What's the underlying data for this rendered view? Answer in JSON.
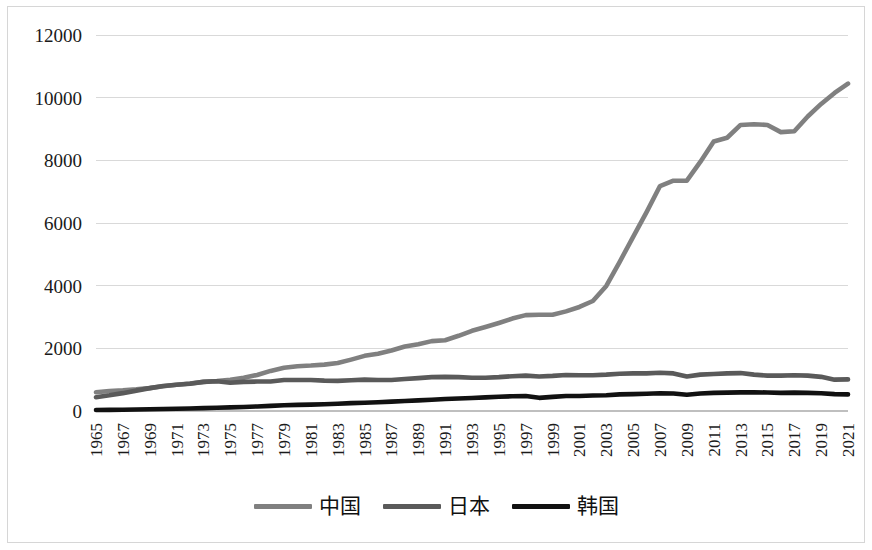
{
  "chart_data": {
    "type": "line",
    "title": "",
    "xlabel": "",
    "ylabel": "",
    "ylim": [
      0,
      12000
    ],
    "ytick_labels": [
      "0",
      "2000",
      "4000",
      "6000",
      "8000",
      "10000",
      "12000"
    ],
    "ytick_values": [
      0,
      2000,
      4000,
      6000,
      8000,
      10000,
      12000
    ],
    "grid": true,
    "legend_position": "bottom",
    "x": [
      1965,
      1966,
      1967,
      1968,
      1969,
      1970,
      1971,
      1972,
      1973,
      1974,
      1975,
      1976,
      1977,
      1978,
      1979,
      1980,
      1981,
      1982,
      1983,
      1984,
      1985,
      1986,
      1987,
      1988,
      1989,
      1990,
      1991,
      1992,
      1993,
      1994,
      1995,
      1996,
      1997,
      1998,
      1999,
      2000,
      2001,
      2002,
      2003,
      2004,
      2005,
      2006,
      2007,
      2008,
      2009,
      2010,
      2011,
      2012,
      2013,
      2014,
      2015,
      2016,
      2017,
      2018,
      2019,
      2020,
      2021
    ],
    "xtick_labels": [
      "1965",
      "1967",
      "1969",
      "1971",
      "1973",
      "1975",
      "1977",
      "1979",
      "1981",
      "1983",
      "1985",
      "1987",
      "1989",
      "1991",
      "1993",
      "1995",
      "1997",
      "1999",
      "2001",
      "2003",
      "2005",
      "2007",
      "2009",
      "2011",
      "2013",
      "2015",
      "2017",
      "2019",
      "2021"
    ],
    "series": [
      {
        "name": "中国",
        "color": "#808080",
        "width": 4.6,
        "values": [
          600,
          640,
          660,
          690,
          730,
          790,
          840,
          880,
          930,
          960,
          1000,
          1060,
          1150,
          1280,
          1380,
          1430,
          1450,
          1480,
          1530,
          1640,
          1760,
          1830,
          1930,
          2060,
          2130,
          2230,
          2260,
          2400,
          2560,
          2680,
          2810,
          2950,
          3060,
          3070,
          3070,
          3180,
          3320,
          3510,
          3990,
          4760,
          5560,
          6350,
          7180,
          7350,
          7350,
          7950,
          8600,
          8720,
          9130,
          9150,
          9130,
          8900,
          8930,
          9400,
          9800,
          10150,
          10450
        ]
      },
      {
        "name": "日本",
        "color": "#5a5a5a",
        "width": 4.6,
        "values": [
          440,
          500,
          570,
          650,
          730,
          800,
          840,
          870,
          930,
          950,
          900,
          930,
          940,
          940,
          990,
          990,
          990,
          970,
          960,
          980,
          1000,
          990,
          990,
          1020,
          1050,
          1080,
          1090,
          1080,
          1060,
          1060,
          1080,
          1110,
          1130,
          1100,
          1120,
          1150,
          1140,
          1140,
          1160,
          1190,
          1200,
          1200,
          1220,
          1200,
          1100,
          1160,
          1180,
          1200,
          1210,
          1160,
          1130,
          1130,
          1140,
          1130,
          1090,
          1000,
          1010
        ]
      },
      {
        "name": "韩国",
        "color": "#111111",
        "width": 4.6,
        "values": [
          30,
          35,
          40,
          48,
          55,
          62,
          70,
          78,
          92,
          105,
          115,
          130,
          145,
          165,
          185,
          195,
          205,
          215,
          230,
          250,
          265,
          280,
          300,
          320,
          340,
          360,
          385,
          400,
          415,
          435,
          455,
          470,
          480,
          420,
          450,
          480,
          480,
          495,
          505,
          530,
          540,
          550,
          565,
          560,
          520,
          560,
          580,
          585,
          595,
          600,
          590,
          580,
          585,
          580,
          565,
          540,
          530
        ]
      }
    ]
  },
  "legend": {
    "items": [
      {
        "label": "中国",
        "color": "#808080"
      },
      {
        "label": "日本",
        "color": "#5a5a5a"
      },
      {
        "label": "韩国",
        "color": "#111111"
      }
    ]
  }
}
